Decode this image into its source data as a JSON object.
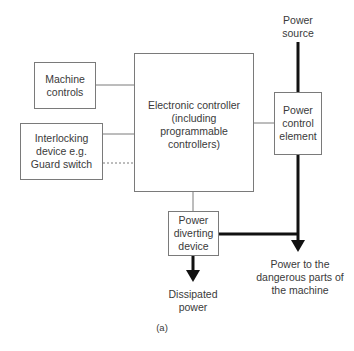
{
  "diagram": {
    "caption": "(a)",
    "nodes": {
      "machine_controls": {
        "label": "Machine controls",
        "lines": [
          "Machine",
          "controls"
        ]
      },
      "interlocking_device": {
        "label": "Interlocking device e.g. Guard switch",
        "lines": [
          "Interlocking",
          "device e.g.",
          "Guard switch"
        ]
      },
      "electronic_controller": {
        "label": "Electronic controller (including programmable controllers)",
        "lines": [
          "Electronic controller",
          "(including",
          "programmable",
          "controllers)"
        ]
      },
      "power_control_element": {
        "label": "Power control element",
        "lines": [
          "Power",
          "control",
          "element"
        ]
      },
      "power_diverting_device": {
        "label": "Power diverting device",
        "lines": [
          "Power",
          "diverting",
          "device"
        ]
      }
    },
    "terminals": {
      "power_source": {
        "label": "Power source",
        "lines": [
          "Power",
          "source"
        ]
      },
      "dissipated_power": {
        "label": "Dissipated power",
        "lines": [
          "Dissipated",
          "power"
        ]
      },
      "power_to_machine": {
        "label": "Power to the dangerous parts of the machine",
        "lines": [
          "Power to the",
          "dangerous parts of",
          "the machine"
        ]
      }
    },
    "edges": [
      {
        "from": "machine_controls",
        "to": "electronic_controller",
        "style": "thin"
      },
      {
        "from": "interlocking_device",
        "to": "electronic_controller",
        "style": "thin"
      },
      {
        "from": "interlocking_device",
        "to": "power_diverting_device",
        "style": "dashed"
      },
      {
        "from": "electronic_controller",
        "to": "power_diverting_device",
        "style": "thin"
      },
      {
        "from": "electronic_controller",
        "to": "power_control_element",
        "style": "thin"
      },
      {
        "from": "power_source",
        "to": "power_control_element",
        "style": "thick"
      },
      {
        "from": "power_control_element",
        "to": "power_to_machine",
        "style": "thick-arrow"
      },
      {
        "from": "power_diverting_device",
        "to": "power_to_machine",
        "style": "thick"
      },
      {
        "from": "power_diverting_device",
        "to": "dissipated_power",
        "style": "thick-arrow"
      }
    ],
    "colors": {
      "thin_line": "#7a7a7a",
      "thick_line": "#111111",
      "text": "#3a3a3a"
    }
  }
}
